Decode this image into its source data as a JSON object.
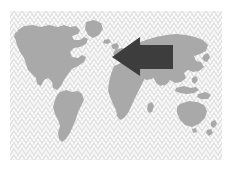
{
  "graphic": {
    "title": "World map with large left-pointing arrow",
    "kind": "illustration",
    "canvas": {
      "width": 231,
      "height": 171
    },
    "background_color": "#ffffff"
  },
  "plate": {
    "name": "hatched background plate",
    "x": 10,
    "y": 11,
    "width": 212,
    "height": 149,
    "fill_color": "#fdfdfd",
    "hatch_color": "#d8d8d8",
    "hatch_style": "diagonal crosshatch diamond lattice",
    "hatch_spacing": 6
  },
  "map": {
    "name": "world map silhouette",
    "projection_look": "equirectangular",
    "land_color": "#a9a9a9",
    "ocean_color": "transparent",
    "continents": [
      {
        "name": "North America"
      },
      {
        "name": "South America"
      },
      {
        "name": "Greenland"
      },
      {
        "name": "Europe"
      },
      {
        "name": "Africa"
      },
      {
        "name": "Asia"
      },
      {
        "name": "Australia"
      },
      {
        "name": "Indonesia"
      },
      {
        "name": "Japan"
      },
      {
        "name": "New Zealand"
      },
      {
        "name": "Madagascar"
      },
      {
        "name": "British Isles"
      },
      {
        "name": "Iceland"
      }
    ]
  },
  "arrow": {
    "name": "left pointing arrow",
    "direction": "left",
    "fill_color": "#3d3d3d",
    "tip_x": 112,
    "tip_y": 57,
    "tail_x": 173,
    "head_top_y": 37,
    "head_bottom_y": 76,
    "shaft_top_y": 45,
    "shaft_bottom_y": 69,
    "points_toward": "Europe"
  },
  "colors": {
    "arrow": "#3d3d3d",
    "land": "#a9a9a9",
    "hatch": "#d8d8d8",
    "page": "#ffffff"
  }
}
